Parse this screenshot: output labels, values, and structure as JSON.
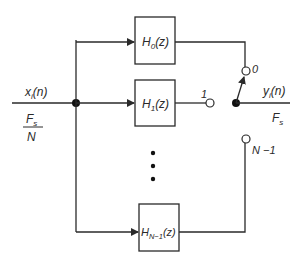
{
  "diagram": {
    "type": "polyphase filter bank with output commutator",
    "input": {
      "signal": "x",
      "signal_sub": "i",
      "signal_arg": "(n)",
      "rate_num": "F",
      "rate_num_sub": "s",
      "rate_den": "N"
    },
    "output": {
      "signal": "y",
      "signal_sub": "i",
      "signal_arg": "(n)",
      "rate": "F",
      "rate_sub": "s"
    },
    "filters": [
      {
        "name": "H",
        "sub": "0",
        "arg": "(z)",
        "switch_label": "0"
      },
      {
        "name": "H",
        "sub": "1",
        "arg": "(z)",
        "switch_label": "1"
      },
      {
        "name": "H",
        "sub": "N−1",
        "arg": "(z)",
        "switch_label": "N −1"
      }
    ],
    "ellipsis": "⋮",
    "colors": {
      "line": "#2a2a2a",
      "background": "#ffffff"
    }
  }
}
